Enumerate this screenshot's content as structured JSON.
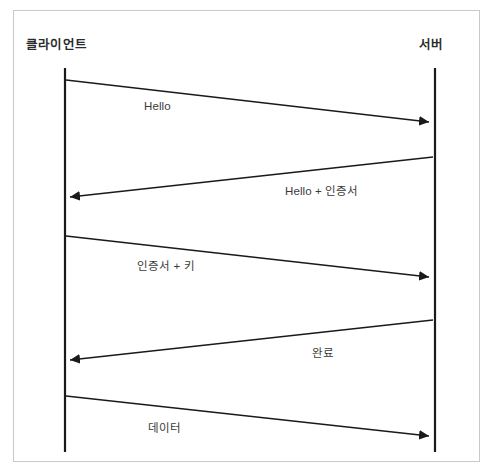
{
  "figure": {
    "kind": "sequence-diagram",
    "title_visible": false,
    "background_color": "#ffffff",
    "frame_color": "#c9c9c9",
    "line_color": "#1a1a1a",
    "text_color": "#2b2b2b",
    "label_color": "#3a3a3a"
  },
  "participants": [
    {
      "id": "client",
      "label": "클라이언트",
      "label_x": 26,
      "label_y": 42,
      "lifeline_x": 65,
      "lifeline_top": 68,
      "lifeline_bottom": 452
    },
    {
      "id": "server",
      "label": "서버",
      "label_x": 419,
      "label_y": 42,
      "lifeline_x": 435,
      "lifeline_top": 68,
      "lifeline_bottom": 452
    }
  ],
  "messages": [
    {
      "index": 1,
      "label": "Hello",
      "from": "client",
      "to": "server",
      "direction": "right",
      "x1": 66,
      "y1": 80,
      "x2": 429,
      "y2": 122,
      "label_x": 144,
      "label_y": 108
    },
    {
      "index": 2,
      "label": "Hello + 인증서",
      "from": "server",
      "to": "client",
      "direction": "left",
      "x1": 433,
      "y1": 157,
      "x2": 70,
      "y2": 197,
      "label_x": 285,
      "label_y": 190
    },
    {
      "index": 3,
      "label": "인증서 + 키",
      "from": "client",
      "to": "server",
      "direction": "right",
      "x1": 66,
      "y1": 236,
      "x2": 429,
      "y2": 277,
      "label_x": 137,
      "label_y": 265
    },
    {
      "index": 4,
      "label": "완료",
      "from": "server",
      "to": "client",
      "direction": "left",
      "x1": 433,
      "y1": 320,
      "x2": 70,
      "y2": 360,
      "label_x": 312,
      "label_y": 352
    },
    {
      "index": 5,
      "label": "데이터",
      "from": "client",
      "to": "server",
      "direction": "right",
      "x1": 66,
      "y1": 396,
      "x2": 429,
      "y2": 436,
      "label_x": 148,
      "label_y": 427
    }
  ]
}
